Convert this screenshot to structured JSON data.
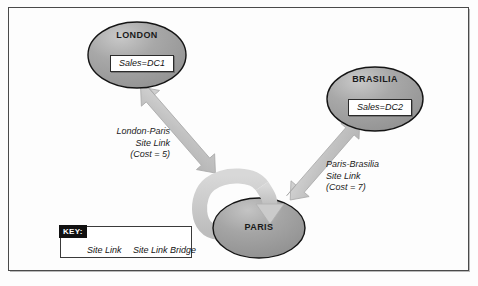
{
  "diagram": {
    "colors": {
      "node_fill": "#9a9a9a",
      "node_fill_light": "#bdbdbd",
      "node_stroke": "#1d1d1d",
      "arrow_fill": "#c3c3c3",
      "arrow_stroke": "#b0b0b0",
      "frame_stroke": "#4a4a4a",
      "background": "#fdfdfd",
      "key_tab_bg": "#111111",
      "key_tab_text": "#ffffff"
    },
    "nodes": [
      {
        "id": "london",
        "label": "LONDON",
        "server_label": "Sales=DC1",
        "shape": "ellipse",
        "cx": 137,
        "cy": 55,
        "rx": 49,
        "ry": 33
      },
      {
        "id": "brasilia",
        "label": "BRASILIA",
        "server_label": "Sales=DC2",
        "shape": "ellipse",
        "cx": 375,
        "cy": 99,
        "rx": 48,
        "ry": 32
      },
      {
        "id": "paris",
        "label": "PARIS",
        "server_label": "",
        "shape": "ellipse",
        "cx": 259,
        "cy": 228,
        "rx": 46,
        "ry": 30
      }
    ],
    "edges": [
      {
        "id": "london-paris",
        "from": "london",
        "to": "paris",
        "kind": "site-link",
        "arrow": "double",
        "label_lines": [
          "London-Paris",
          "Site Link",
          "(Cost = 5)"
        ],
        "cost": 5
      },
      {
        "id": "paris-brasilia",
        "from": "paris",
        "to": "brasilia",
        "kind": "site-link",
        "arrow": "double",
        "label_lines": [
          "Paris-Brasilia",
          "Site Link",
          "(Cost = 7)"
        ],
        "cost": 7
      },
      {
        "id": "paris-bridge",
        "from": "paris",
        "to": "paris",
        "kind": "site-link-bridge",
        "arrow": "single",
        "label_lines": [],
        "cost": null
      }
    ]
  },
  "labels": {
    "london_title": "LONDON",
    "london_sales": "Sales=DC1",
    "brasilia_title": "BRASILIA",
    "brasilia_sales": "Sales=DC2",
    "paris_title": "PARIS",
    "london_paris_l1": "London-Paris",
    "london_paris_l2": "Site Link",
    "london_paris_l3": "(Cost = 5)",
    "paris_brasilia_l1": "Paris-Brasilia",
    "paris_brasilia_l2": "Site Link",
    "paris_brasilia_l3": "(Cost = 7)"
  },
  "legend": {
    "key_label": "KEY:",
    "items": [
      {
        "id": "site-link",
        "caption": "Site Link",
        "swatch": "bar-swatch"
      },
      {
        "id": "site-link-bridge",
        "caption": "Site Link Bridge",
        "swatch": "ring-swatch"
      }
    ]
  }
}
